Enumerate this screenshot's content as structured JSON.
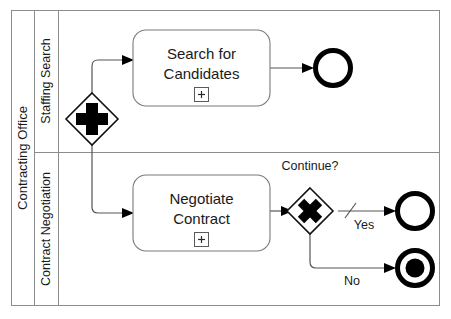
{
  "diagram": {
    "type": "bpmn-collaboration",
    "pool": {
      "name": "Contracting Office"
    },
    "lanes": [
      {
        "id": "lane-staffing-search",
        "name": "Staffing Search"
      },
      {
        "id": "lane-contract-negotiation",
        "name": "Contract Negotiation"
      }
    ],
    "tasks": [
      {
        "id": "task-search-for-candidates",
        "lane": "lane-staffing-search",
        "line1": "Search for",
        "line2": "Candidates",
        "marker": "subprocess-plus",
        "marker_glyph": "+"
      },
      {
        "id": "task-negotiate-contract",
        "lane": "lane-contract-negotiation",
        "line1": "Negotiate",
        "line2": "Contract",
        "marker": "subprocess-plus",
        "marker_glyph": "+"
      }
    ],
    "gateways": [
      {
        "id": "gateway-parallel-split",
        "kind": "parallel",
        "glyph": "+",
        "label": ""
      },
      {
        "id": "gateway-exclusive-continue",
        "kind": "exclusive",
        "glyph": "×",
        "label": "Continue?"
      }
    ],
    "events": [
      {
        "id": "end-event-staffing-search",
        "kind": "end-event",
        "lane": "lane-staffing-search"
      },
      {
        "id": "end-event-yes",
        "kind": "end-event",
        "lane": "lane-contract-negotiation"
      },
      {
        "id": "terminate-end-event-no",
        "kind": "terminate-end-event",
        "lane": "lane-contract-negotiation"
      }
    ],
    "flows": [
      {
        "id": "flow-split-to-search",
        "label": "",
        "is_default": false
      },
      {
        "id": "flow-search-to-end",
        "label": "",
        "is_default": false
      },
      {
        "id": "flow-split-to-negotiate",
        "label": "",
        "is_default": false
      },
      {
        "id": "flow-negotiate-to-gateway",
        "label": "",
        "is_default": false
      },
      {
        "id": "flow-gateway-yes",
        "label": "Yes",
        "is_default": true
      },
      {
        "id": "flow-gateway-no",
        "label": "No",
        "is_default": false
      }
    ],
    "colors": {
      "background": "#ffffff",
      "frame_stroke": "#8c8c8c",
      "task_stroke": "#7a7a7a",
      "flow_stroke": "#555555",
      "shape_stroke": "#111111",
      "glyph_fill": "#000000",
      "text": "#1a1a1a"
    }
  }
}
